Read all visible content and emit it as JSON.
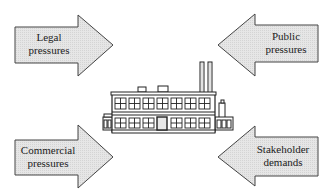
{
  "diagram": {
    "title": "",
    "center": {
      "label": "factory",
      "icon": "factory-icon"
    },
    "arrows": [
      {
        "id": "legal",
        "lines": [
          "Legal",
          "pressures"
        ],
        "direction": "right",
        "position": "top-left"
      },
      {
        "id": "public",
        "lines": [
          "Public",
          "pressures"
        ],
        "direction": "left",
        "position": "top-right"
      },
      {
        "id": "commercial",
        "lines": [
          "Commercial",
          "pressures"
        ],
        "direction": "right",
        "position": "bottom-left"
      },
      {
        "id": "stakeholder",
        "lines": [
          "Stakeholder",
          "demands"
        ],
        "direction": "left",
        "position": "bottom-right"
      }
    ],
    "colors": {
      "arrow_fill": "#e4e4e4",
      "arrow_stroke": "#444444",
      "building_stroke": "#222222",
      "building_fill": "#ffffff"
    }
  }
}
